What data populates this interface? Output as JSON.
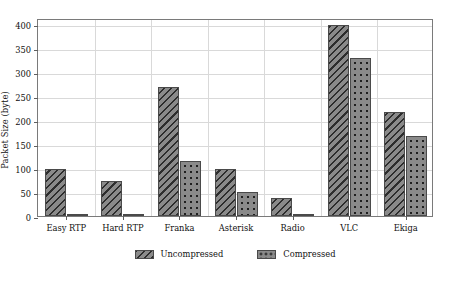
{
  "chart_data": {
    "type": "bar",
    "title": "",
    "xlabel": "",
    "ylabel": "Packet Size (byte)",
    "categories": [
      "Easy RTP",
      "Hard RTP",
      "Franka",
      "Asterisk",
      "Radio",
      "VLC",
      "Ekiga"
    ],
    "series": [
      {
        "name": "Uncompressed",
        "values": [
          98,
          72,
          268,
          98,
          38,
          397,
          216
        ]
      },
      {
        "name": "Compressed",
        "values": [
          4,
          3,
          114,
          50,
          4,
          328,
          167
        ]
      }
    ],
    "yticks": [
      0,
      50,
      100,
      150,
      200,
      250,
      300,
      350,
      400
    ],
    "ylim": [
      0,
      412
    ],
    "grid": true,
    "legend_position": "bottom-center",
    "colors": {
      "bar_fill": "#8a8a8a",
      "bar_edge": "#4a4a4a",
      "grid": "#d9d9d9",
      "frame": "#7a7a7a",
      "text": "#111111",
      "background": "#ffffff"
    }
  }
}
